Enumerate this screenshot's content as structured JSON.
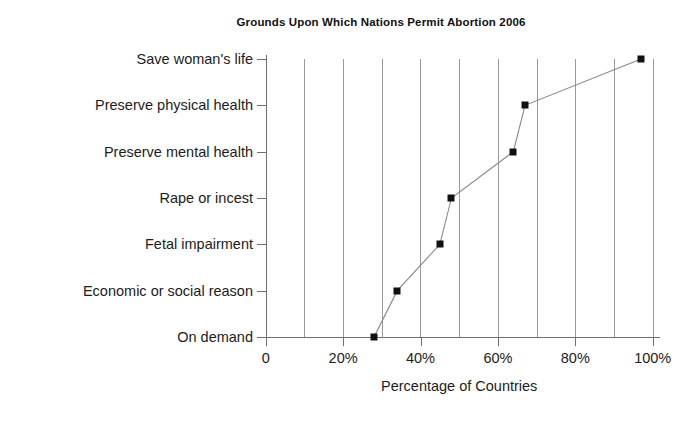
{
  "chart_data": {
    "type": "line",
    "title": "Grounds Upon Which Nations Permit Abortion 2006",
    "xlabel": "Percentage of Countries",
    "ylabel": "",
    "orientation": "horizontal",
    "marker": "square",
    "marker_color": "#111111",
    "line_color": "#888888",
    "grid": "vertical-every-10-percent",
    "legend": "none",
    "xlim": [
      0,
      100
    ],
    "xticks": [
      0,
      20,
      40,
      60,
      80,
      100
    ],
    "xticklabels": [
      "0",
      "20%",
      "40%",
      "60%",
      "80%",
      "100%"
    ],
    "gridline_values": [
      10,
      20,
      30,
      40,
      50,
      60,
      70,
      80,
      90,
      100
    ],
    "categories": [
      "Save woman's life",
      "Preserve physical health",
      "Preserve mental health",
      "Rape or incest",
      "Fetal impairment",
      "Economic or social reason",
      "On demand"
    ],
    "values": [
      97,
      67,
      64,
      48,
      45,
      34,
      28
    ],
    "points": [
      {
        "category": "Save woman's life",
        "value": 97
      },
      {
        "category": "Preserve physical health",
        "value": 67
      },
      {
        "category": "Preserve mental health",
        "value": 64
      },
      {
        "category": "Rape or incest",
        "value": 48
      },
      {
        "category": "Fetal impairment",
        "value": 45
      },
      {
        "category": "Economic or social reason",
        "value": 34
      },
      {
        "category": "On demand",
        "value": 28
      }
    ]
  }
}
